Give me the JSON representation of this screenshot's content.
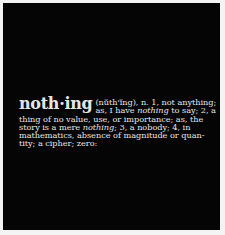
{
  "artwork": {
    "background_color": "#050505",
    "text_color": "#e6e6e6",
    "headword": "noth·ing",
    "pronunciation_line": "(nŭth'ĭng), n. 1, not anything;",
    "line2_a": "as, I have ",
    "line2_em": "nothing",
    "line2_b": " to say; 2, a",
    "line3": "thing of no value, use, or importance; as, the",
    "line4_a": "story is a mere ",
    "line4_em": "nothing",
    "line4_b": "; 3, a nobody; 4, in",
    "line5": "mathematics, absence of magnitude or quan-",
    "line6": "tity; a cipher; zero:"
  }
}
